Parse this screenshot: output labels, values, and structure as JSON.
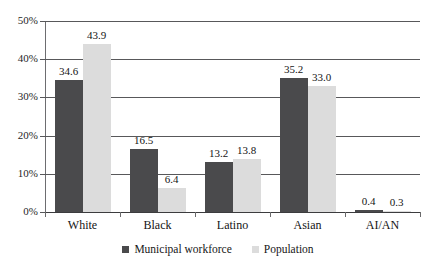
{
  "chart_data": {
    "type": "bar",
    "title": "",
    "subtitle": "",
    "xlabel": "",
    "ylabel": "",
    "categories": [
      "White",
      "Black",
      "Latino",
      "Asian",
      "AI/AN"
    ],
    "series": [
      {
        "name": "Municipal workforce",
        "color": "#4a4a4c",
        "values": [
          34.6,
          16.5,
          13.2,
          35.2,
          0.4
        ],
        "labels": [
          "34.6",
          "16.5",
          "13.2",
          "35.2",
          "0.4"
        ]
      },
      {
        "name": "Population",
        "color": "#dcdcdc",
        "values": [
          43.9,
          6.4,
          13.8,
          33.0,
          0.3
        ],
        "labels": [
          "43.9",
          "6.4",
          "13.8",
          "33.0",
          "0.3"
        ]
      }
    ],
    "ylim": [
      0,
      50
    ],
    "yticks": [
      0,
      10,
      20,
      30,
      40,
      50
    ],
    "ytick_labels": [
      "0%",
      "10%",
      "20%",
      "30%",
      "40%",
      "50%"
    ],
    "grid": true,
    "legend_position": "bottom"
  },
  "legend": {
    "items": [
      {
        "label": "Municipal workforce"
      },
      {
        "label": "Population"
      }
    ]
  }
}
